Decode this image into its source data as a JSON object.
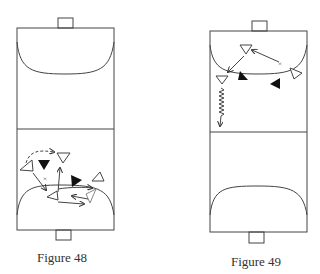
{
  "figures": [
    {
      "id": "figure-48",
      "caption": "Figure 48",
      "court": {
        "left": 17,
        "right": 114,
        "top": 28,
        "mid": 129,
        "bottom": 230
      },
      "goal_top": {
        "x": 58,
        "y": 18,
        "w": 15,
        "h": 10
      },
      "goal_bottom": {
        "x": 56,
        "y": 230,
        "w": 15,
        "h": 10
      },
      "caption_pos": {
        "x": 62,
        "y": 250
      },
      "attackers_label": "open triangles (attackers)",
      "defenders_label": "filled triangles (defenders)"
    },
    {
      "id": "figure-49",
      "caption": "Figure 49",
      "court": {
        "left": 210,
        "right": 307,
        "top": 31,
        "mid": 132,
        "bottom": 232
      },
      "goal_top": {
        "x": 252,
        "y": 21,
        "w": 15,
        "h": 10
      },
      "goal_bottom": {
        "x": 249,
        "y": 232,
        "w": 15,
        "h": 11
      },
      "caption_pos": {
        "x": 256,
        "y": 254
      }
    }
  ],
  "colors": {
    "line": "#333333",
    "fill": "#111111",
    "background": "#ffffff"
  },
  "legend_icons": {
    "attacker": "open-triangle-icon",
    "defender": "filled-triangle-icon",
    "pass": "solid-arrow",
    "run": "dashed-arrow",
    "dribble": "zigzag-arrow",
    "position": "cross-mark"
  }
}
